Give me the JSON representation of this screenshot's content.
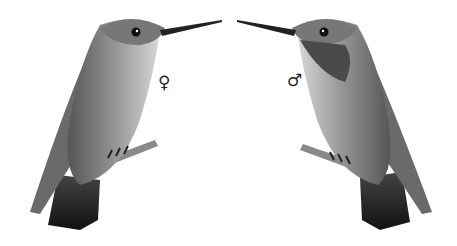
{
  "illustration": {
    "subject": "Two hummingbirds perched on twigs, facing each other",
    "style": "grayscale engraving",
    "left_bird": {
      "sex": "female",
      "symbol": "♀",
      "facing": "right"
    },
    "right_bird": {
      "sex": "male",
      "symbol": "♂",
      "facing": "left"
    }
  },
  "colors": {
    "background": "#ffffff",
    "ink": "#222222",
    "mid": "#8a8a8a",
    "light": "#cfcfcf"
  }
}
